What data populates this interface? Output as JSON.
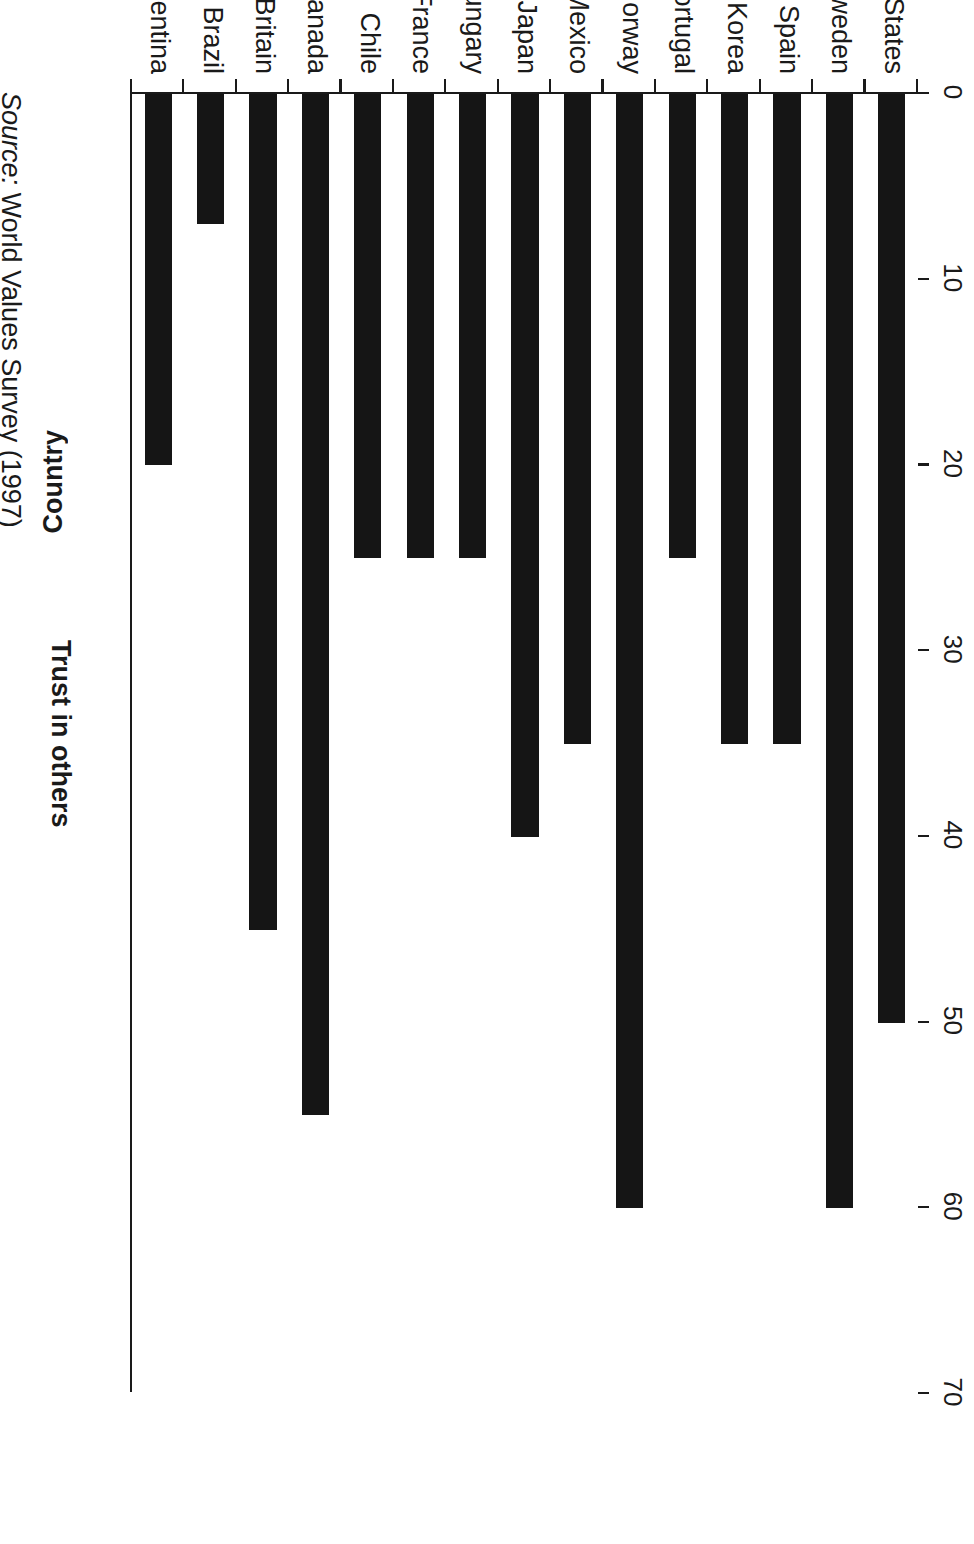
{
  "chart_data": {
    "type": "bar",
    "title": "",
    "orientation": "vertical",
    "xlabel": "Country",
    "ylabel": "Trust in others",
    "ylim": [
      0,
      70
    ],
    "ytick_interval": 10,
    "yticks": [
      "0",
      "10",
      "20",
      "30",
      "40",
      "50",
      "60",
      "70"
    ],
    "grid": false,
    "legend": false,
    "bar_color": "#151515",
    "categories": [
      "United States",
      "Sweden",
      "Spain",
      "South Korea",
      "Portugal",
      "Norway",
      "Mexico",
      "Japan",
      "Hungary",
      "France",
      "Chile",
      "Canada",
      "Britain",
      "Brazil",
      "Argentina"
    ],
    "values": [
      50,
      60,
      35,
      35,
      25,
      60,
      35,
      40,
      25,
      25,
      25,
      55,
      45,
      7,
      20
    ]
  },
  "source": {
    "label": "Source:",
    "text": "World Values Survey (1997)"
  }
}
